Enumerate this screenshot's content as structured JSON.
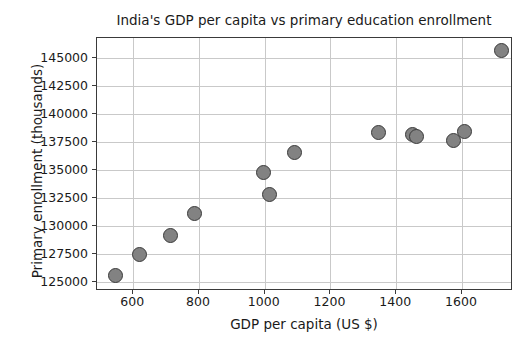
{
  "chart_data": {
    "type": "scatter",
    "title": "India's GDP per capita vs primary education enrollment",
    "xlabel": "GDP per capita (US $)",
    "ylabel": "Primary enrollment (thousands)",
    "xlim": [
      490,
      1755
    ],
    "ylim": [
      124200,
      146800
    ],
    "grid": true,
    "legend": null,
    "xticks": [
      600,
      800,
      1000,
      1200,
      1400,
      1600
    ],
    "xtick_labels": [
      "600",
      "800",
      "1000",
      "1200",
      "1400",
      "1600"
    ],
    "yticks": [
      125000,
      127500,
      130000,
      132500,
      135000,
      137500,
      140000,
      142500,
      145000
    ],
    "ytick_labels": [
      "125000",
      "127500",
      "130000",
      "132500",
      "135000",
      "137500",
      "140000",
      "142500",
      "145000"
    ],
    "marker": {
      "shape": "circle",
      "face_color": "#828282",
      "edge_color": "#3b3b3b",
      "size_px": 15
    },
    "series": [
      {
        "name": "India",
        "points": [
          {
            "x": 545,
            "y": 125600
          },
          {
            "x": 620,
            "y": 127450
          },
          {
            "x": 712,
            "y": 129200
          },
          {
            "x": 788,
            "y": 131100
          },
          {
            "x": 995,
            "y": 134800
          },
          {
            "x": 1015,
            "y": 132800
          },
          {
            "x": 1092,
            "y": 136600
          },
          {
            "x": 1345,
            "y": 138350
          },
          {
            "x": 1450,
            "y": 138200
          },
          {
            "x": 1462,
            "y": 138000
          },
          {
            "x": 1575,
            "y": 137600
          },
          {
            "x": 1608,
            "y": 138450
          },
          {
            "x": 1720,
            "y": 145700
          }
        ]
      }
    ]
  }
}
